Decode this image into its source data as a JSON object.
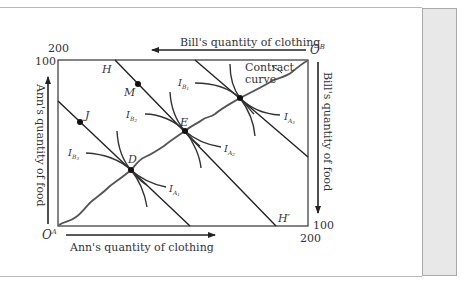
{
  "figure": {
    "origins": {
      "ann": "O",
      "ann_sup": "A",
      "bill": "O",
      "bill_sup": "B"
    },
    "axes": {
      "bill_clothing": "Bill's quantity of clothing",
      "bill_food": "Bill's quantity of food",
      "ann_food": "Ann's quantity of food",
      "ann_clothing": "Ann's quantity of clothing"
    },
    "ticks": {
      "top_left_200": "200",
      "top_left_100": "100",
      "bottom_right_100": "100",
      "bottom_right_200": "200"
    },
    "points": {
      "H": "H",
      "H_prime": "H′",
      "M": "M",
      "J": "J",
      "E": "E",
      "D": "D"
    },
    "indifference_curves": {
      "IB1": {
        "main": "I",
        "sub": "B",
        "subnum": "1"
      },
      "IB2": {
        "main": "I",
        "sub": "B",
        "subnum": "2"
      },
      "IB3": {
        "main": "I",
        "sub": "B",
        "subnum": "3"
      },
      "IA1": {
        "main": "I",
        "sub": "A",
        "subnum": "1"
      },
      "IA2": {
        "main": "I",
        "sub": "A",
        "subnum": "2"
      },
      "IA3": {
        "main": "I",
        "sub": "A",
        "subnum": "3"
      }
    },
    "contract_curve": {
      "line1": "Contract",
      "line2": "curve"
    }
  }
}
